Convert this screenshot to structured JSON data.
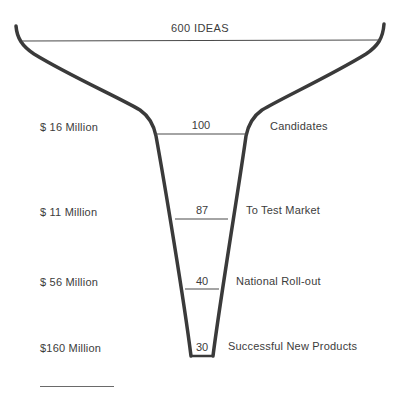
{
  "diagram": {
    "type": "funnel",
    "top": {
      "count": "600",
      "label": "600 IDEAS"
    },
    "stages": [
      {
        "count": "100",
        "stage": "Candidates",
        "cost": "$ 16 Million"
      },
      {
        "count": "87",
        "stage": "To Test Market",
        "cost": "$ 11 Million"
      },
      {
        "count": "40",
        "stage": "National Roll-out",
        "cost": "$ 56 Million"
      },
      {
        "count": "30",
        "stage": "Successful New Products",
        "cost": "$160 Million"
      }
    ],
    "colors": {
      "stroke": "#3a3a3a",
      "text": "#3c3c3c",
      "background": "#ffffff"
    }
  }
}
